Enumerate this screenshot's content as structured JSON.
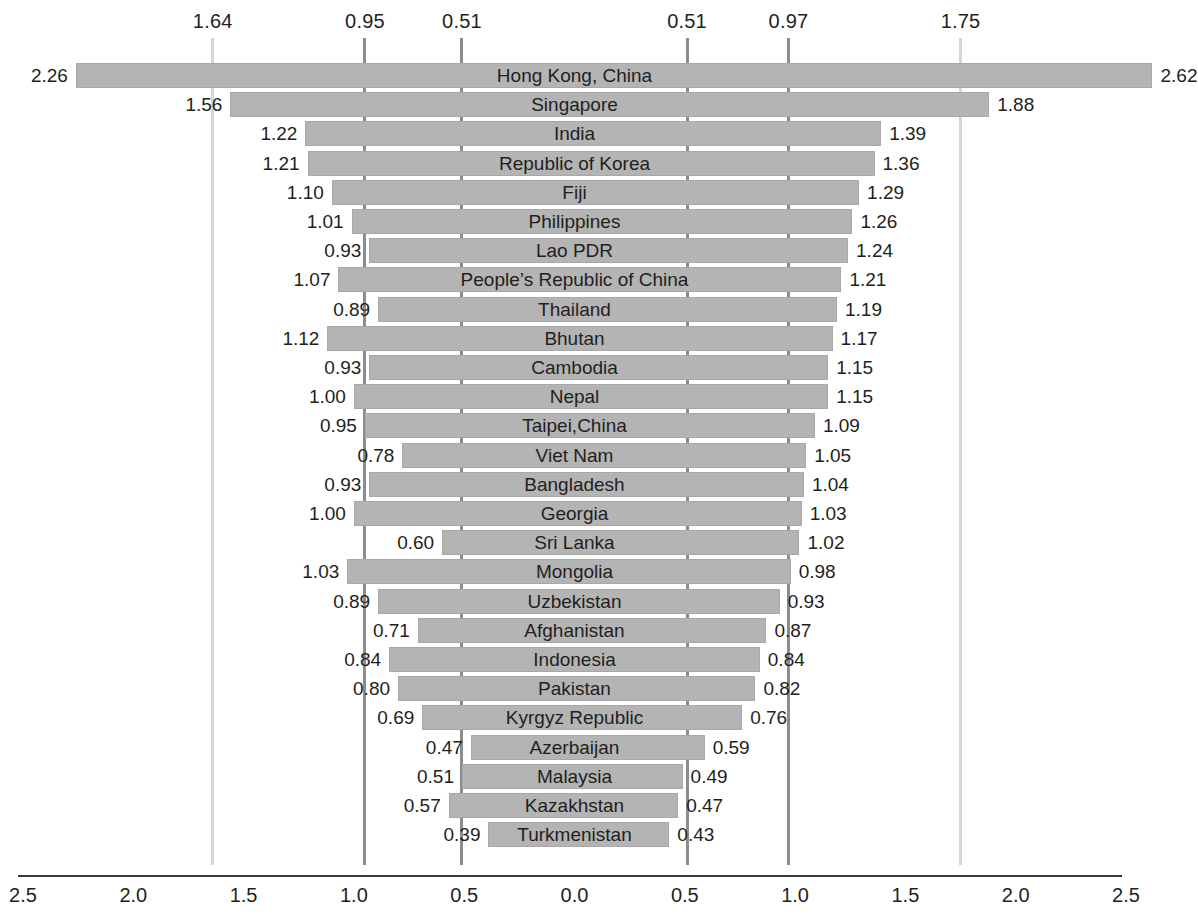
{
  "chart_data": {
    "type": "bar",
    "orientation": "horizontal-diverging",
    "title": "",
    "subtitle": "",
    "xlabel": "",
    "ylabel": "",
    "xlim": [
      -2.5,
      2.5
    ],
    "grid": false,
    "legend": null,
    "axis": {
      "tick_labels": [
        "2.5",
        "2.0",
        "1.5",
        "1.0",
        "0.5",
        "0.0",
        "0.5",
        "1.0",
        "1.5",
        "2.0",
        "2.5"
      ],
      "tick_values": [
        -2.5,
        -2.0,
        -1.5,
        -1.0,
        -0.5,
        0.0,
        0.5,
        1.0,
        1.5,
        2.0,
        2.5
      ]
    },
    "reference_lines": [
      {
        "label": "1.64",
        "value": -1.64,
        "shade": "light"
      },
      {
        "label": "0.95",
        "value": -0.95,
        "shade": "dark"
      },
      {
        "label": "0.51",
        "value": -0.51,
        "shade": "dark"
      },
      {
        "label": "0.51",
        "value": 0.51,
        "shade": "dark"
      },
      {
        "label": "0.97",
        "value": 0.97,
        "shade": "dark"
      },
      {
        "label": "1.75",
        "value": 1.75,
        "shade": "light"
      }
    ],
    "categories": [
      "Hong Kong, China",
      "Singapore",
      "India",
      "Republic of Korea",
      "Fiji",
      "Philippines",
      "Lao PDR",
      "People’s Republic of China",
      "Thailand",
      "Bhutan",
      "Cambodia",
      "Nepal",
      "Taipei,China",
      "Viet Nam",
      "Bangladesh",
      "Georgia",
      "Sri Lanka",
      "Mongolia",
      "Uzbekistan",
      "Afghanistan",
      "Indonesia",
      "Pakistan",
      "Kyrgyz Republic",
      "Azerbaijan",
      "Malaysia",
      "Kazakhstan",
      "Turkmenistan"
    ],
    "series": [
      {
        "name": "left",
        "labels": [
          "2.26",
          "1.56",
          "1.22",
          "1.21",
          "1.10",
          "1.01",
          "0.93",
          "1.07",
          "0.89",
          "1.12",
          "0.93",
          "1.00",
          "0.95",
          "0.78",
          "0.93",
          "1.00",
          "0.60",
          "1.03",
          "0.89",
          "0.71",
          "0.84",
          "0.80",
          "0.69",
          "0.47",
          "0.51",
          "0.57",
          "0.39"
        ],
        "values": [
          2.26,
          1.56,
          1.22,
          1.21,
          1.1,
          1.01,
          0.93,
          1.07,
          0.89,
          1.12,
          0.93,
          1.0,
          0.95,
          0.78,
          0.93,
          1.0,
          0.6,
          1.03,
          0.89,
          0.71,
          0.84,
          0.8,
          0.69,
          0.47,
          0.51,
          0.57,
          0.39
        ]
      },
      {
        "name": "right",
        "labels": [
          "2.62",
          "1.88",
          "1.39",
          "1.36",
          "1.29",
          "1.26",
          "1.24",
          "1.21",
          "1.19",
          "1.17",
          "1.15",
          "1.15",
          "1.09",
          "1.05",
          "1.04",
          "1.03",
          "1.02",
          "0.98",
          "0.93",
          "0.87",
          "0.84",
          "0.82",
          "0.76",
          "0.59",
          "0.49",
          "0.47",
          "0.43"
        ],
        "values": [
          2.62,
          1.88,
          1.39,
          1.36,
          1.29,
          1.26,
          1.24,
          1.21,
          1.19,
          1.17,
          1.15,
          1.15,
          1.09,
          1.05,
          1.04,
          1.03,
          1.02,
          0.98,
          0.93,
          0.87,
          0.84,
          0.82,
          0.76,
          0.59,
          0.49,
          0.47,
          0.43
        ]
      }
    ],
    "colors": {
      "bar": "#b4b4b4",
      "bar_border": "#a8a8a8",
      "reference_line_dark": "#8c8c8c",
      "reference_line_light": "#d6d6d6",
      "axis": "#3a3a3a",
      "text": "#231f20"
    }
  },
  "layout": {
    "center_x": 574.5,
    "px_per_unit": 220.6,
    "first_row_top": 61,
    "row_height": 29.2,
    "axis_y": 875
  }
}
